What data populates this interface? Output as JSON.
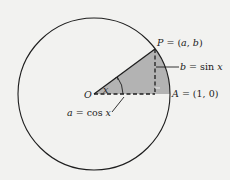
{
  "diagram": {
    "type": "unit-circle",
    "colors": {
      "background": "#f2f2f0",
      "stroke": "#1e1e1e",
      "sector_fill": "#b3b3b3"
    },
    "circle": {
      "cx": 94,
      "cy": 94,
      "r": 76
    },
    "points": {
      "O": {
        "x": 94,
        "y": 94
      },
      "P": {
        "x": 155,
        "y": 49
      },
      "A": {
        "x": 170,
        "y": 94
      },
      "foot": {
        "x": 155,
        "y": 94
      }
    },
    "labels": {
      "origin": "O",
      "point_p_name": "P",
      "point_p_eq": "= (",
      "point_p_a": "a",
      "point_p_comma": ", ",
      "point_p_b": "b",
      "point_p_close": ")",
      "point_a_name": "A",
      "point_a_eq": "= (1, 0)",
      "angle": "x",
      "sin_b": "b",
      "sin_eq": "= sin ",
      "sin_x": "x",
      "cos_a": "a",
      "cos_eq": "= cos ",
      "cos_x": "x"
    }
  }
}
